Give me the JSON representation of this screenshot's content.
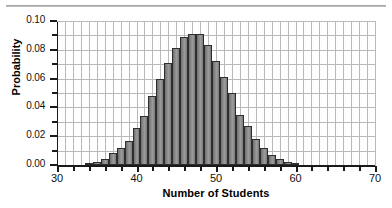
{
  "chart_data": {
    "type": "bar",
    "title": "",
    "xlabel": "Number of Students",
    "ylabel": "Probability",
    "xlim": [
      30,
      70
    ],
    "ylim": [
      0.0,
      0.1
    ],
    "grid": true,
    "legend": null,
    "x_tick_labels": [
      "30",
      "40",
      "50",
      "60",
      "70"
    ],
    "x_tick_values": [
      30,
      40,
      50,
      60,
      70
    ],
    "x_minor_tick_step": 2,
    "y_tick_labels": [
      "0.00",
      "0.02",
      "0.04",
      "0.06",
      "0.08",
      "0.10"
    ],
    "y_tick_values": [
      0.0,
      0.02,
      0.04,
      0.06,
      0.08,
      0.1
    ],
    "y_minor_tick_step": 0.01,
    "bar_width_units": 1,
    "categories": [
      34,
      35,
      36,
      37,
      38,
      39,
      40,
      41,
      42,
      43,
      44,
      45,
      46,
      47,
      48,
      49,
      50,
      51,
      52,
      53,
      54,
      55,
      56,
      57,
      58,
      59,
      60
    ],
    "values": [
      0.001,
      0.002,
      0.004,
      0.008,
      0.012,
      0.017,
      0.026,
      0.034,
      0.048,
      0.06,
      0.071,
      0.081,
      0.089,
      0.091,
      0.091,
      0.083,
      0.072,
      0.061,
      0.05,
      0.035,
      0.027,
      0.018,
      0.012,
      0.007,
      0.004,
      0.002,
      0.001
    ]
  },
  "axes": {
    "y_title": "Probability",
    "x_title": "Number of Students"
  }
}
